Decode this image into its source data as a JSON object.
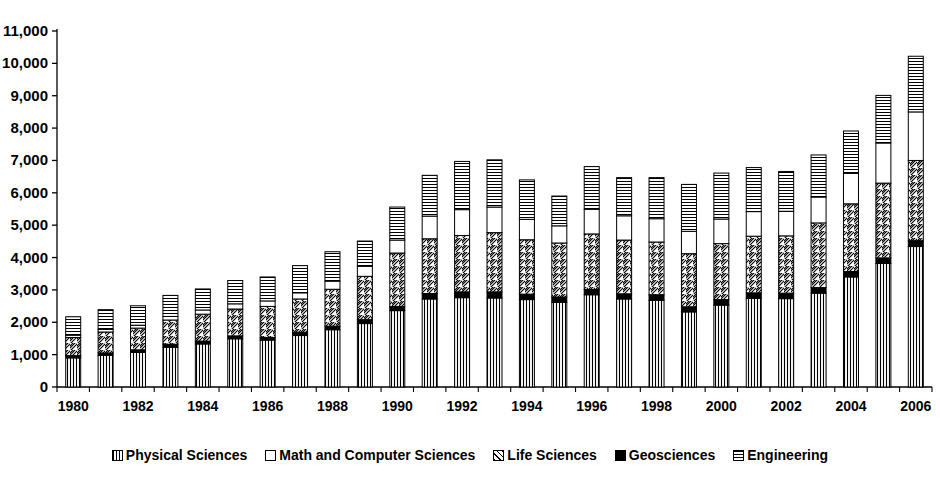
{
  "chart_data": {
    "type": "bar",
    "stacked": true,
    "title": "",
    "subtitle": "",
    "xlabel": "",
    "ylabel": "",
    "grid": false,
    "legend_position": "bottom",
    "ylim": [
      0,
      11000
    ],
    "ytick_step": 1000,
    "ytick_labels": [
      "0",
      "1,000",
      "2,000",
      "3,000",
      "4,000",
      "5,000",
      "6,000",
      "7,000",
      "8,000",
      "9,000",
      "10,000",
      "11,000"
    ],
    "ytick_values": [
      0,
      1000,
      2000,
      3000,
      4000,
      5000,
      6000,
      7000,
      8000,
      9000,
      10000,
      11000
    ],
    "categories": [
      "1980",
      "1981",
      "1982",
      "1983",
      "1984",
      "1985",
      "1986",
      "1987",
      "1988",
      "1989",
      "1990",
      "1991",
      "1992",
      "1993",
      "1994",
      "1995",
      "1996",
      "1997",
      "1998",
      "1999",
      "2000",
      "2001",
      "2002",
      "2003",
      "2004",
      "2005",
      "2006"
    ],
    "xtick_labels_shown": [
      "1980",
      "1982",
      "1984",
      "1986",
      "1988",
      "1990",
      "1992",
      "1994",
      "1996",
      "1998",
      "2000",
      "2002",
      "2004",
      "2006"
    ],
    "series": [
      {
        "name": "Physical Sciences",
        "pattern": "vertical-lines",
        "color": "#000000",
        "values": [
          900,
          980,
          1070,
          1230,
          1330,
          1490,
          1450,
          1590,
          1770,
          1960,
          2360,
          2720,
          2760,
          2750,
          2700,
          2620,
          2850,
          2720,
          2680,
          2320,
          2530,
          2740,
          2730,
          2900,
          3400,
          3820,
          4340
        ]
      },
      {
        "name": "Geosciences",
        "pattern": "solid-black",
        "color": "#000000",
        "values": [
          70,
          70,
          80,
          90,
          90,
          90,
          80,
          100,
          110,
          120,
          130,
          170,
          180,
          190,
          170,
          160,
          160,
          160,
          170,
          160,
          170,
          170,
          170,
          170,
          170,
          170,
          180
        ]
      },
      {
        "name": "Life Sciences",
        "pattern": "diagonal-hatch",
        "color": "#000000",
        "values": [
          560,
          650,
          670,
          750,
          830,
          830,
          960,
          1030,
          1140,
          1340,
          1650,
          1690,
          1740,
          1830,
          1680,
          1670,
          1720,
          1660,
          1630,
          1640,
          1730,
          1750,
          1770,
          2000,
          2090,
          2310,
          2480
        ]
      },
      {
        "name": "Math and Computer Sciences",
        "pattern": "empty",
        "color": "#ffffff",
        "values": [
          70,
          80,
          90,
          110,
          130,
          160,
          170,
          190,
          250,
          310,
          400,
          700,
          800,
          790,
          630,
          530,
          760,
          750,
          720,
          690,
          760,
          760,
          760,
          800,
          940,
          1240,
          1500
        ]
      },
      {
        "name": "Engineering",
        "pattern": "horizontal-lines",
        "color": "#000000",
        "values": [
          570,
          610,
          600,
          650,
          650,
          720,
          740,
          840,
          910,
          780,
          1020,
          1260,
          1490,
          1460,
          1220,
          920,
          1320,
          1180,
          1270,
          1450,
          1420,
          1360,
          1230,
          1300,
          1310,
          1470,
          1720
        ]
      }
    ],
    "totals": [
      2170,
      2390,
      2510,
      2830,
      3030,
      3290,
      3400,
      3750,
      4180,
      4510,
      5560,
      6540,
      6970,
      7020,
      6400,
      5900,
      6810,
      6470,
      6470,
      6260,
      6610,
      6780,
      6660,
      7170,
      7910,
      9010,
      10220
    ]
  },
  "legend": {
    "items": [
      {
        "label": "Physical Sciences",
        "swatch_class": "sw-vert",
        "icon": "legend-swatch-physical-sciences"
      },
      {
        "label": "Math and Computer Sciences",
        "swatch_class": "sw-empty",
        "icon": "legend-swatch-math-computer-sciences"
      },
      {
        "label": "Life Sciences",
        "swatch_class": "sw-diag",
        "icon": "legend-swatch-life-sciences"
      },
      {
        "label": "Geosciences",
        "swatch_class": "sw-solid",
        "icon": "legend-swatch-geosciences"
      },
      {
        "label": "Engineering",
        "swatch_class": "sw-horiz",
        "icon": "legend-swatch-engineering"
      }
    ]
  }
}
